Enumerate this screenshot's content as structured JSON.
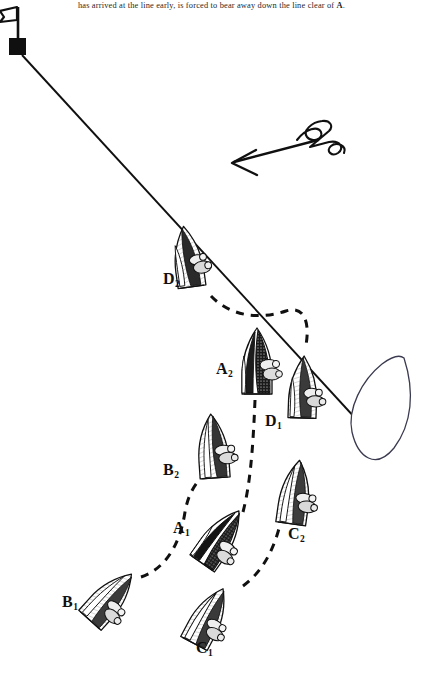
{
  "figure": {
    "caption": "has arrived at the line early, is forced to bear away down the line clear of ",
    "caption_emphasis": "A",
    "caption_tail": ".",
    "type": "sailing-racing-rules-diagram",
    "background_color": "#ffffff",
    "ink_color": "#101010"
  },
  "marks": {
    "pin_flag": {
      "name": "pin-end-flag",
      "x": 18,
      "y": 50
    },
    "committee_boat": {
      "name": "committee-boat",
      "x": 390,
      "y": 420
    }
  },
  "start_line": {
    "label": "start-line",
    "from_x": 22,
    "from_y": 55,
    "to_x": 368,
    "to_y": 432
  },
  "wind": {
    "label": "wind-arrow",
    "direction": "from upper-right to lower-left",
    "tip_x": 232,
    "tip_y": 163,
    "tail_x": 318,
    "tail_y": 140
  },
  "boats": [
    {
      "id": "D2",
      "letter": "D",
      "sub": "2",
      "label_x": 163,
      "label_y": 279,
      "boat_x": 188,
      "boat_y": 258,
      "rotation": -8,
      "sail": "light",
      "heel": 0
    },
    {
      "id": "A2",
      "letter": "A",
      "sub": "2",
      "label_x": 216,
      "label_y": 369,
      "boat_x": 257,
      "boat_y": 362,
      "rotation": 0,
      "sail": "dark",
      "heel": 0
    },
    {
      "id": "D1",
      "letter": "D",
      "sub": "1",
      "label_x": 265,
      "label_y": 421,
      "boat_x": 303,
      "boat_y": 388,
      "rotation": 2,
      "sail": "light",
      "heel": 0
    },
    {
      "id": "B2",
      "letter": "B",
      "sub": "2",
      "label_x": 163,
      "label_y": 470,
      "boat_x": 213,
      "boat_y": 447,
      "rotation": -4,
      "sail": "light",
      "heel": 0
    },
    {
      "id": "C2",
      "letter": "C",
      "sub": "2",
      "label_x": 288,
      "label_y": 534,
      "boat_x": 295,
      "boat_y": 493,
      "rotation": 8,
      "sail": "light",
      "heel": 0
    },
    {
      "id": "A1",
      "letter": "A",
      "sub": "1",
      "label_x": 173,
      "label_y": 528,
      "boat_x": 220,
      "boat_y": 538,
      "rotation": 35,
      "sail": "dark",
      "heel": 1
    },
    {
      "id": "B1",
      "letter": "B",
      "sub": "1",
      "label_x": 62,
      "label_y": 602,
      "boat_x": 110,
      "boat_y": 598,
      "rotation": 42,
      "sail": "light",
      "heel": 1
    },
    {
      "id": "C1",
      "letter": "C",
      "sub": "1",
      "label_x": 196,
      "label_y": 648,
      "boat_x": 208,
      "boat_y": 617,
      "rotation": 28,
      "sail": "light",
      "heel": 1
    }
  ],
  "tracks": [
    {
      "id": "track-D",
      "from": "D2",
      "to": "D1",
      "style": "dashed"
    },
    {
      "id": "track-A",
      "from": "A1",
      "to": "A2",
      "style": "dashed"
    },
    {
      "id": "track-B",
      "from": "B1",
      "to": "B2",
      "style": "dashed"
    },
    {
      "id": "track-C",
      "from": "C1",
      "to": "C2",
      "style": "dashed"
    }
  ]
}
